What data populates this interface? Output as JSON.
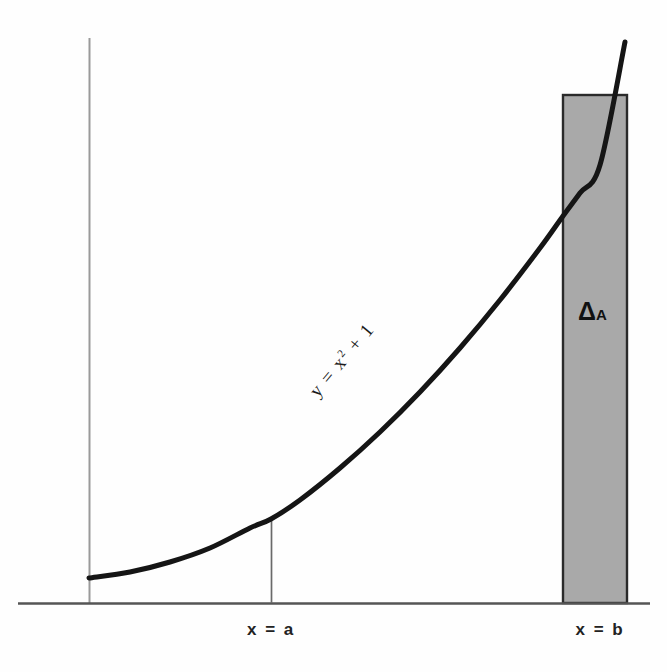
{
  "figure": {
    "background_color": "#fefefe",
    "curve_label": {
      "full_text": "y = x2 + 1",
      "prefix": "y = x",
      "exponent": "2",
      "suffix": " + 1"
    },
    "region_label": {
      "delta": "Δ",
      "subject": "A",
      "full_text": "ΔA"
    },
    "x_axis": {
      "ticks": [
        {
          "id": "a",
          "label": "x = a",
          "x_px": 271
        },
        {
          "id": "b",
          "label": "x = b",
          "x_px": 600
        }
      ]
    },
    "colors": {
      "curve": "#151515",
      "axis": "#555555",
      "y_axis": "#9a9a9a",
      "rect_fill": "#a9a9a9",
      "rect_stroke": "#2a2a2a",
      "tick_line": "#6a6a6a",
      "text": "#1a1a1a"
    }
  },
  "chart_data": {
    "type": "line",
    "title": "",
    "xlabel": "",
    "ylabel": "",
    "annotations": [
      {
        "text": "y = x2 + 1",
        "role": "curve-equation"
      },
      {
        "text": "ΔA",
        "role": "area-element"
      },
      {
        "text": "x = a",
        "role": "x-tick"
      },
      {
        "text": "x = b",
        "role": "x-tick"
      }
    ],
    "grid": false,
    "legend": null,
    "series": [
      {
        "name": "y = x^2 + 1",
        "comment": "Increasing convex curve drawn in pixel coordinates (origin top-left of 667x672 canvas).",
        "points_px": [
          [
            89,
            578
          ],
          [
            130,
            572
          ],
          [
            170,
            562
          ],
          [
            210,
            548
          ],
          [
            250,
            528
          ],
          [
            271,
            519
          ],
          [
            300,
            500
          ],
          [
            340,
            468
          ],
          [
            380,
            432
          ],
          [
            420,
            392
          ],
          [
            460,
            348
          ],
          [
            500,
            300
          ],
          [
            540,
            248
          ],
          [
            563,
            216
          ],
          [
            580,
            193
          ],
          [
            600,
            165
          ],
          [
            625,
            42
          ]
        ]
      }
    ],
    "shaded_region": {
      "label": "ΔA",
      "shape": "rectangle",
      "x_px": 563,
      "y_px": 95,
      "width_px": 64,
      "height_px": 508,
      "fill": "#a9a9a9"
    },
    "axes_px": {
      "x_axis": {
        "x1": 18,
        "y1": 603,
        "x2": 650,
        "y2": 603
      },
      "y_axis": {
        "x1": 89,
        "y1": 38,
        "x2": 89,
        "y2": 603
      }
    },
    "tick_lines_px": [
      {
        "id": "a",
        "x": 271,
        "y_top": 519,
        "y_bottom": 603
      }
    ]
  }
}
